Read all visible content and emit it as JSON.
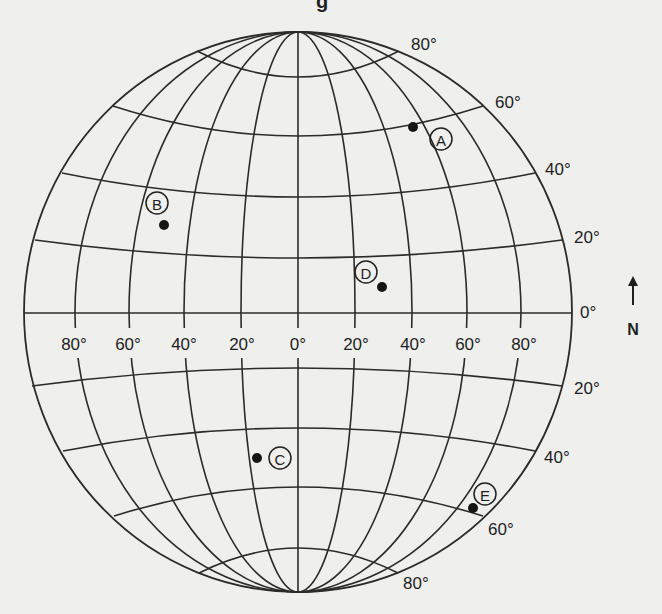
{
  "figure": {
    "type": "latitude-longitude grid (globe)",
    "top_fragment": "g",
    "background": "#efefed",
    "line_color": "#2b2b2b"
  },
  "globe": {
    "center": [
      298,
      312
    ],
    "rx": 274,
    "ry": 280,
    "north_pole": [
      298,
      32
    ],
    "south_pole": [
      298,
      592
    ]
  },
  "meridians": [
    {
      "deg": "80° W",
      "equator_x": 75
    },
    {
      "deg": "60° W",
      "equator_x": 129
    },
    {
      "deg": "40° W",
      "equator_x": 184
    },
    {
      "deg": "20° W",
      "equator_x": 241
    },
    {
      "deg": "0°",
      "equator_x": 298
    },
    {
      "deg": "20° E",
      "equator_x": 355
    },
    {
      "deg": "40° E",
      "equator_x": 412
    },
    {
      "deg": "60° E",
      "equator_x": 467
    },
    {
      "deg": "80° E",
      "equator_x": 521
    }
  ],
  "parallels": [
    {
      "deg": "80° N",
      "left": [
        197,
        51
      ],
      "right": [
        399,
        51
      ],
      "center_y": 77
    },
    {
      "deg": "60° N",
      "left": [
        113,
        106
      ],
      "right": [
        483,
        106
      ],
      "center_y": 136
    },
    {
      "deg": "40° N",
      "left": [
        62,
        173
      ],
      "right": [
        535,
        173
      ],
      "center_y": 197
    },
    {
      "deg": "20° N",
      "left": [
        35,
        240
      ],
      "right": [
        562,
        240
      ],
      "center_y": 258
    },
    {
      "deg": "0°",
      "left": [
        24,
        313
      ],
      "right": [
        572,
        313
      ],
      "center_y": 313
    },
    {
      "deg": "20° S",
      "left": [
        32,
        386
      ],
      "right": [
        562,
        386
      ],
      "center_y": 368
    },
    {
      "deg": "40° S",
      "left": [
        63,
        451
      ],
      "right": [
        535,
        451
      ],
      "center_y": 428
    },
    {
      "deg": "60° S",
      "left": [
        114,
        516
      ],
      "right": [
        483,
        516
      ],
      "center_y": 487
    },
    {
      "deg": "80° S",
      "left": [
        199,
        573
      ],
      "right": [
        398,
        573
      ],
      "center_y": 548
    }
  ],
  "longitude_labels": [
    {
      "text": "80°",
      "x": 74
    },
    {
      "text": "60°",
      "x": 128
    },
    {
      "text": "40°",
      "x": 184
    },
    {
      "text": "20°",
      "x": 242
    },
    {
      "text": "0°",
      "x": 298
    },
    {
      "text": "20°",
      "x": 356
    },
    {
      "text": "40°",
      "x": 413
    },
    {
      "text": "60°",
      "x": 468
    },
    {
      "text": "80°",
      "x": 524
    }
  ],
  "longitude_label_y": 350,
  "latitude_labels": [
    {
      "text": "80°",
      "x": 411,
      "y": 50,
      "hemisphere": "N"
    },
    {
      "text": "60°",
      "x": 495,
      "y": 108,
      "hemisphere": "N"
    },
    {
      "text": "40°",
      "x": 545,
      "y": 175,
      "hemisphere": "N"
    },
    {
      "text": "20°",
      "x": 574,
      "y": 243,
      "hemisphere": "N"
    },
    {
      "text": "0°",
      "x": 580,
      "y": 318,
      "hemisphere": "Equator"
    },
    {
      "text": "20°",
      "x": 574,
      "y": 394,
      "hemisphere": "S"
    },
    {
      "text": "40°",
      "x": 544,
      "y": 463,
      "hemisphere": "S"
    },
    {
      "text": "60°",
      "x": 488,
      "y": 535,
      "hemisphere": "S"
    },
    {
      "text": "80°",
      "x": 403,
      "y": 589,
      "hemisphere": "S"
    }
  ],
  "points": [
    {
      "id": "A",
      "dot": [
        413,
        127
      ],
      "label": [
        441,
        139
      ]
    },
    {
      "id": "B",
      "dot": [
        164,
        225
      ],
      "label": [
        157,
        203
      ]
    },
    {
      "id": "C",
      "dot": [
        257,
        458
      ],
      "label": [
        280,
        458
      ]
    },
    {
      "id": "D",
      "dot": [
        382,
        287
      ],
      "label": [
        366,
        272
      ]
    },
    {
      "id": "E",
      "dot": [
        473,
        508
      ],
      "label": [
        485,
        494
      ]
    }
  ],
  "compass": {
    "label": "N",
    "arrow": "north-arrow",
    "x": 633,
    "arrow_top": 276,
    "arrow_bottom": 305,
    "label_y": 335
  }
}
